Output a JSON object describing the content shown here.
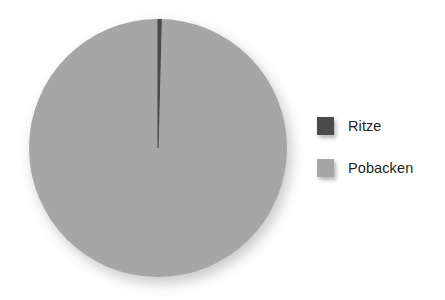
{
  "background_color": "#ffffff",
  "chart_data": {
    "type": "pie",
    "title": "",
    "subtitle": "",
    "xlabel": "",
    "ylabel": "",
    "grid": false,
    "legend_position": "right",
    "start_angle_deg": 0,
    "direction": "clockwise",
    "labels": [
      "Ritze",
      "Pobacken"
    ],
    "values": [
      0.4,
      99.6
    ],
    "value_unit": "%",
    "colors": [
      "#4a4a4a",
      "#a6a6a6"
    ],
    "slices": [
      {
        "label": "Ritze",
        "value": 0.4,
        "angle_deg": 1.44,
        "color": "#4a4a4a"
      },
      {
        "label": "Pobacken",
        "value": 99.6,
        "angle_deg": 358.56,
        "color": "#a6a6a6"
      }
    ],
    "annotations": []
  },
  "legend": {
    "items": [
      {
        "label": "Ritze",
        "color": "#4a4a4a"
      },
      {
        "label": "Pobacken",
        "color": "#a6a6a6"
      }
    ]
  }
}
